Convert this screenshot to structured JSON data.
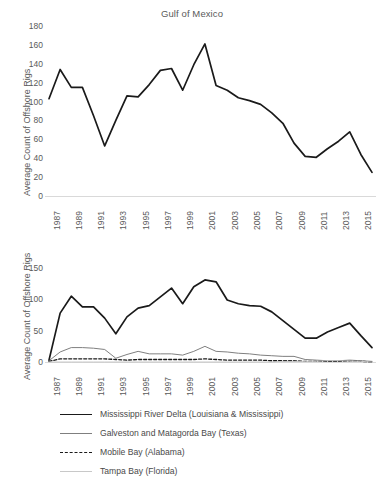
{
  "figure": {
    "ylabel": "Average Count of Offshore Rigs",
    "colors": {
      "axis": "#d9d9d9",
      "text": "#5a5a5a",
      "mississippi": "#1a1a1a",
      "galveston": "#7f7f7f",
      "mobile": "#1a1a1a",
      "tampa": "#c8c8c8"
    }
  },
  "chart_data": [
    {
      "type": "line",
      "title": "Gulf of Mexico",
      "xlabel": "",
      "ylabel": "Average Count of Offshore Rigs",
      "ylim": [
        0,
        180
      ],
      "yticks": [
        0,
        20,
        40,
        60,
        80,
        100,
        120,
        140,
        160,
        180
      ],
      "xticks": [
        "1987",
        "1989",
        "1991",
        "1993",
        "1995",
        "1997",
        "1999",
        "2001",
        "2003",
        "2005",
        "2007",
        "2009",
        "2011",
        "2013",
        "2015"
      ],
      "grid": false,
      "legend": "none",
      "x": [
        1987,
        1988,
        1989,
        1990,
        1991,
        1992,
        1993,
        1994,
        1995,
        1996,
        1997,
        1998,
        1999,
        2000,
        2001,
        2002,
        2003,
        2004,
        2005,
        2006,
        2007,
        2008,
        2009,
        2010,
        2011,
        2012,
        2013,
        2014,
        2015,
        2016
      ],
      "series": [
        {
          "name": "Gulf of Mexico",
          "values": [
            103,
            134,
            115,
            115,
            85,
            53,
            80,
            106,
            105,
            118,
            133,
            135,
            112,
            139,
            161,
            117,
            112,
            104,
            101,
            97,
            88,
            77,
            56,
            42,
            41,
            50,
            58,
            68,
            44,
            25
          ]
        }
      ]
    },
    {
      "type": "line",
      "title": "Gulf of Mexico Subregions",
      "xlabel": "",
      "ylabel": "Average Count of Offshore Rigs",
      "ylim": [
        0,
        150
      ],
      "yticks": [
        0,
        50,
        100,
        150
      ],
      "xticks": [
        "1987",
        "1989",
        "1991",
        "1993",
        "1995",
        "1997",
        "1999",
        "2001",
        "2003",
        "2005",
        "2007",
        "2009",
        "2011",
        "2013",
        "2015"
      ],
      "grid": false,
      "legend": "below",
      "x": [
        1987,
        1988,
        1989,
        1990,
        1991,
        1992,
        1993,
        1994,
        1995,
        1996,
        1997,
        1998,
        1999,
        2000,
        2001,
        2002,
        2003,
        2004,
        2005,
        2006,
        2007,
        2008,
        2009,
        2010,
        2011,
        2012,
        2013,
        2014,
        2015,
        2016
      ],
      "series": [
        {
          "name": "Mississippi River Delta (Louisiana & Mississippi)",
          "style": "solid-thick",
          "color": "#1a1a1a",
          "values": [
            3,
            78,
            105,
            88,
            88,
            70,
            45,
            72,
            86,
            90,
            104,
            118,
            93,
            120,
            131,
            128,
            99,
            93,
            90,
            89,
            80,
            66,
            52,
            38,
            38,
            48,
            55,
            62,
            42,
            23
          ]
        },
        {
          "name": "Galveston and Matagorda Bay (Texas)",
          "style": "solid-thin",
          "color": "#7f7f7f",
          "values": [
            2,
            16,
            23,
            23,
            22,
            20,
            6,
            12,
            17,
            13,
            13,
            13,
            11,
            17,
            25,
            17,
            16,
            14,
            13,
            11,
            10,
            9,
            9,
            4,
            3,
            2,
            2,
            3,
            2,
            1
          ]
        },
        {
          "name": "Mobile Bay (Alabama)",
          "style": "dashed",
          "color": "#1a1a1a",
          "values": [
            1,
            5,
            5,
            5,
            5,
            5,
            4,
            3,
            4,
            4,
            4,
            4,
            4,
            4,
            5,
            4,
            3,
            3,
            3,
            3,
            2,
            2,
            2,
            1,
            1,
            1,
            1,
            1,
            1,
            0
          ]
        },
        {
          "name": "Tampa Bay (Florida)",
          "style": "solid-light",
          "color": "#c8c8c8",
          "values": [
            0,
            0,
            0,
            0,
            0,
            0,
            0,
            0,
            0,
            0,
            0,
            0,
            0,
            0,
            0,
            0,
            0,
            0,
            0,
            0,
            0,
            1,
            1,
            1,
            1,
            2,
            2,
            1,
            1,
            0
          ]
        }
      ]
    }
  ],
  "legend": {
    "items": [
      {
        "label": "Mississippi River Delta (Louisiana & Mississippi)",
        "style": "solid-thick",
        "color": "#1a1a1a"
      },
      {
        "label": "Galveston and Matagorda Bay (Texas)",
        "style": "solid-thin",
        "color": "#7f7f7f"
      },
      {
        "label": "Mobile Bay (Alabama)",
        "style": "dashed",
        "color": "#1a1a1a"
      },
      {
        "label": "Tampa Bay (Florida)",
        "style": "solid-light",
        "color": "#c8c8c8"
      }
    ]
  }
}
